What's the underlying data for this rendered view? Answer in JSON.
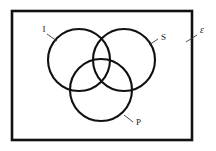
{
  "figure": {
    "type": "venn-diagram",
    "set_count": 3,
    "background_color": "#ffffff",
    "stroke_color": "#111111",
    "universe": {
      "label": "ε",
      "label_name": "epsilon",
      "rect": {
        "x": 12,
        "y": 11,
        "width": 180,
        "height": 129
      },
      "label_position": {
        "x": 200,
        "y": 33
      },
      "leader": {
        "x1": 186,
        "y1": 42,
        "x2": 197,
        "y2": 35
      }
    },
    "circles": [
      {
        "label": "I",
        "name": "circle-i",
        "cx": 79,
        "cy": 60,
        "r": 31,
        "label_position": {
          "x": 44,
          "y": 32
        },
        "leader": {
          "x1": 47,
          "y1": 34,
          "x2": 57,
          "y2": 41
        }
      },
      {
        "label": "S",
        "name": "circle-s",
        "cx": 124,
        "cy": 60,
        "r": 31,
        "label_position": {
          "x": 161,
          "y": 40
        },
        "leader": {
          "x1": 149,
          "y1": 45,
          "x2": 158,
          "y2": 39
        }
      },
      {
        "label": "P",
        "name": "circle-p",
        "cx": 101,
        "cy": 90,
        "r": 31,
        "label_position": {
          "x": 136,
          "y": 125
        },
        "leader": {
          "x1": 124,
          "y1": 115,
          "x2": 133,
          "y2": 122
        }
      }
    ]
  }
}
